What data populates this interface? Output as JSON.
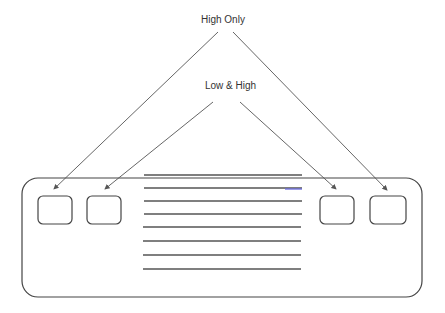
{
  "labels": {
    "high_only": "High Only",
    "low_and_high": "Low & High"
  },
  "diagram": {
    "panel": {
      "x": 22,
      "y": 178,
      "w": 400,
      "h": 119,
      "r": 16
    },
    "buttons": [
      {
        "name": "button-far-left",
        "x": 38,
        "y": 196,
        "w": 34,
        "h": 28
      },
      {
        "name": "button-inner-left",
        "x": 87,
        "y": 196,
        "w": 34,
        "h": 28
      },
      {
        "name": "button-inner-right",
        "x": 320,
        "y": 196,
        "w": 34,
        "h": 28
      },
      {
        "name": "button-far-right",
        "x": 370,
        "y": 196,
        "w": 36,
        "h": 28
      }
    ],
    "lines_y": [
      175,
      188,
      201,
      214,
      227,
      241,
      255,
      269
    ],
    "colors": {
      "stroke": "#444444",
      "arrow": "#555555",
      "accent": "#6a6adf"
    }
  }
}
